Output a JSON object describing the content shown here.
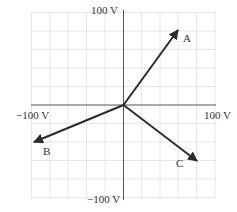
{
  "diagram": {
    "type": "phasor-vector-diagram",
    "axes": {
      "x_max_label": "100 V",
      "x_min_label": "−100 V",
      "y_max_label": "100 V",
      "y_min_label": "−100 V",
      "grid_divisions_per_side": 5,
      "grid_step_volts": 20
    },
    "vectors": [
      {
        "label": "A",
        "x": 60,
        "y": 80
      },
      {
        "label": "B",
        "x": -96,
        "y": -40
      },
      {
        "label": "C",
        "x": 80,
        "y": -60
      }
    ],
    "colors": {
      "vector": "#2b2b2b",
      "axis": "#555555",
      "grid": "#e6e6e6"
    }
  }
}
